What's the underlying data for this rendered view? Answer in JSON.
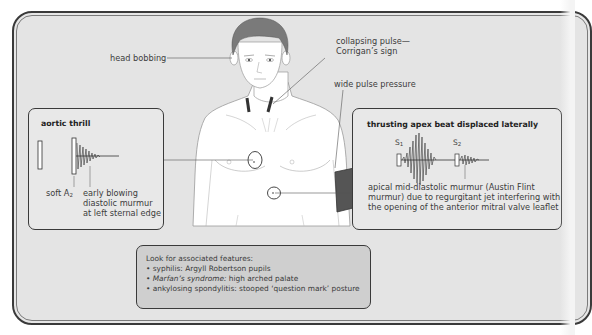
{
  "diagram": {
    "figure": {
      "description": "Front-facing male torso with blood pressure cuff on left arm",
      "cuff_color": "#555555",
      "neck_marker_color": "#3a3a3a"
    },
    "callouts": {
      "head_bobbing": "head bobbing",
      "collapsing_pulse_line1": "collapsing pulse—",
      "collapsing_pulse_line2": "Corrigan’s sign",
      "wide_pulse_pressure": "wide pulse pressure"
    },
    "aortic_thrill_box": {
      "title": "aortic thrill",
      "soft_a2_prefix": "soft A",
      "soft_a2_sub": "2",
      "murmur_line1": "early blowing",
      "murmur_line2": "diastolic murmur",
      "murmur_line3": "at left sternal edge"
    },
    "apex_beat_box": {
      "title": "thrusting apex beat displaced laterally",
      "s1_prefix": "S",
      "s1_sub": "1",
      "s2_prefix": "S",
      "s2_sub": "2",
      "desc_line1": "apical mid-diastolic murmur (Austin Flint",
      "desc_line2": "murmur) due to regurgitant jet interfering with",
      "desc_line3": "the opening of the anterior mitral valve leaflet"
    },
    "associated_features": {
      "heading": "Look for associated features:",
      "items": [
        {
          "bullet": "•",
          "prefix": "syphilis: ",
          "text": "Argyll Robertson pupils"
        },
        {
          "bullet": "•",
          "prefix": "Marfan’s syndrome: ",
          "text": "high arched palate"
        },
        {
          "bullet": "•",
          "prefix": "ankylosing spondylitis: ",
          "text": "stooped ‘question mark’ posture"
        }
      ]
    },
    "colors": {
      "background": "#e4e4e4",
      "frame": "#3a3a3a",
      "features_box": "#cfcfcf",
      "skin": "#ffffff",
      "hair": "#7a7a7a"
    }
  }
}
